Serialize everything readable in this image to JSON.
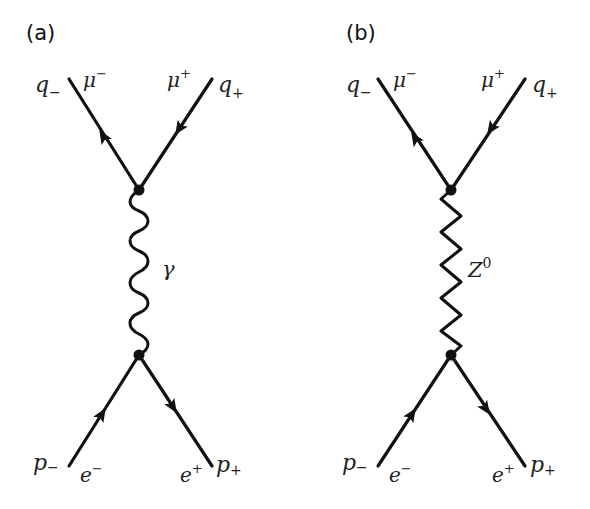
{
  "figure": {
    "panels": [
      {
        "id": "a",
        "label": "(a)",
        "propagator": {
          "particle": "photon",
          "symbol": "γ",
          "style": "wavy"
        },
        "top_left": {
          "momentum": "q",
          "momentum_sub": "−",
          "particle": "μ",
          "particle_sup": "−"
        },
        "top_right": {
          "momentum": "q",
          "momentum_sub": "+",
          "particle": "μ",
          "particle_sup": "+"
        },
        "bottom_left": {
          "momentum": "p",
          "momentum_sub": "−",
          "particle": "e",
          "particle_sup": "−"
        },
        "bottom_right": {
          "momentum": "p",
          "momentum_sub": "+",
          "particle": "e",
          "particle_sup": "+"
        }
      },
      {
        "id": "b",
        "label": "(b)",
        "propagator": {
          "particle": "Z boson",
          "symbol": "Z",
          "symbol_sup": "0",
          "style": "zigzag"
        },
        "top_left": {
          "momentum": "q",
          "momentum_sub": "−",
          "particle": "μ",
          "particle_sup": "−"
        },
        "top_right": {
          "momentum": "q",
          "momentum_sub": "+",
          "particle": "μ",
          "particle_sup": "+"
        },
        "bottom_left": {
          "momentum": "p",
          "momentum_sub": "−",
          "particle": "e",
          "particle_sup": "−"
        },
        "bottom_right": {
          "momentum": "p",
          "momentum_sub": "+",
          "particle": "e",
          "particle_sup": "+"
        }
      }
    ]
  }
}
